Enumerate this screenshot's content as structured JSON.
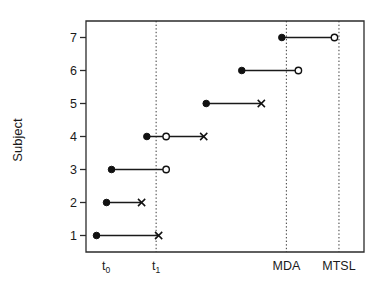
{
  "chart_data": {
    "type": "scatter",
    "title": "",
    "xlabel": "",
    "ylabel": "Subject",
    "grid": false,
    "legend": "none",
    "ylim": [
      0.5,
      7.5
    ],
    "y_ticks": [
      "1",
      "2",
      "3",
      "4",
      "5",
      "6",
      "7"
    ],
    "x_ticks": [
      {
        "label": "t",
        "sub": "0",
        "value": 1,
        "reference_line": false
      },
      {
        "label": "t",
        "sub": "1",
        "value": 3,
        "reference_line": true
      },
      {
        "label": "MDA",
        "sub": "",
        "value": 8.2,
        "reference_line": true
      },
      {
        "label": "MTSL",
        "sub": "",
        "value": 10.3,
        "reference_line": true
      }
    ],
    "xlim": [
      0.2,
      11.3
    ],
    "marker_types": {
      "filled_circle": "event-start",
      "open_circle": "event-censored-observed",
      "cross": "event-end"
    },
    "subjects": [
      {
        "subject": 1,
        "start": 0.62,
        "end": 3.1,
        "end_marker": "cross",
        "mid": null
      },
      {
        "subject": 2,
        "start": 1.02,
        "end": 2.42,
        "end_marker": "cross",
        "mid": null
      },
      {
        "subject": 3,
        "start": 1.22,
        "end": 3.4,
        "end_marker": "open_circle",
        "mid": null
      },
      {
        "subject": 4,
        "start": 2.63,
        "end": 4.9,
        "end_marker": "cross",
        "mid": 3.4
      },
      {
        "subject": 5,
        "start": 5.0,
        "end": 7.2,
        "end_marker": "cross",
        "mid": null
      },
      {
        "subject": 6,
        "start": 6.42,
        "end": 8.68,
        "end_marker": "open_circle",
        "mid": null
      },
      {
        "subject": 7,
        "start": 8.02,
        "end": 10.12,
        "end_marker": "open_circle",
        "mid": null
      }
    ]
  },
  "colors": {
    "axis": "#2b2b2b",
    "marker": "#111111",
    "reference_line": "#3a3a3a",
    "background": "#ffffff"
  }
}
